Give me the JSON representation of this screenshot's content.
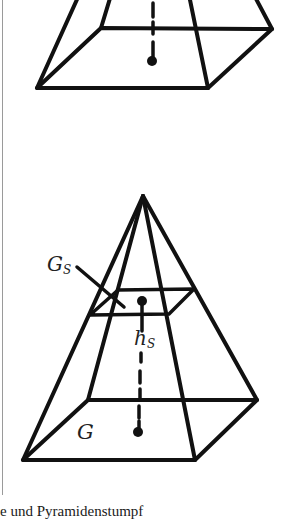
{
  "figure": {
    "top_shape": "pyramid (cropped, apex off-screen)",
    "bottom_shape": "pyramid with parallel cross-section",
    "labels": {
      "cross_section_area": {
        "main": "G",
        "sub": "S"
      },
      "section_height": {
        "main": "h",
        "sub": "S"
      },
      "base_area": "G"
    },
    "line_color": "#111111",
    "border_color": "#9a9a9a"
  },
  "caption": "e und Pyramidenstumpf"
}
